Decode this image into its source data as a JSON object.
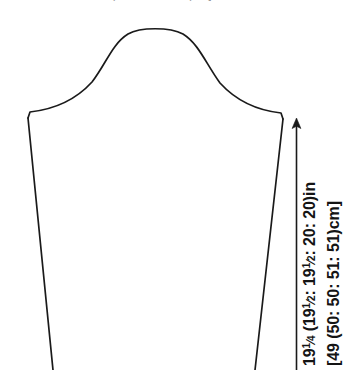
{
  "figure": {
    "type": "sleeve-schematic",
    "background_color": "#ffffff",
    "line_color": "#1a1a1a",
    "top_caption_fragment": "…in (… : … : … : …)cm]"
  },
  "dimension": {
    "arrow_direction": "up",
    "imperial": {
      "whole_1": "19",
      "frac_1_num": "1",
      "frac_1_den": "4",
      "open_paren": " (19",
      "frac_2_num": "1",
      "frac_2_den": "2",
      "mid_a": ": 19",
      "frac_3_num": "1",
      "frac_3_den": "2",
      "tail": ": 20: 20)in",
      "full_text": "19 1/4 (19 1/2: 19 1/2: 20: 20)in"
    },
    "metric": {
      "full_text": "[49 (50: 50: 51: 51)cm]"
    },
    "sizes": [
      "19 1/4",
      "19 1/2",
      "19 1/2",
      "20",
      "20"
    ],
    "sizes_cm": [
      49,
      50,
      50,
      51,
      51
    ],
    "unit_imperial": "in",
    "unit_metric": "cm"
  },
  "shape": {
    "name": "sleeve",
    "cap_apex_y": 28,
    "underarm_left": [
      28,
      118
    ],
    "underarm_right": [
      283,
      119
    ],
    "cuff_left_x": 53,
    "cuff_right_x": 255
  }
}
